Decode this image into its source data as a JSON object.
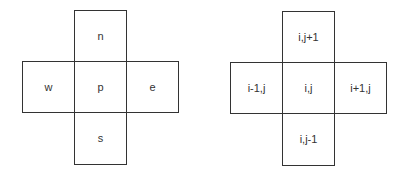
{
  "figures": [
    {
      "name": "compass-notation",
      "cells": {
        "north": "n",
        "west": "w",
        "center": "p",
        "east": "e",
        "south": "s"
      }
    },
    {
      "name": "index-notation",
      "cells": {
        "north": "i,j+1",
        "west": "i-1,j",
        "center": "i,j",
        "east": "i+1,j",
        "south": "i,j-1"
      }
    }
  ]
}
